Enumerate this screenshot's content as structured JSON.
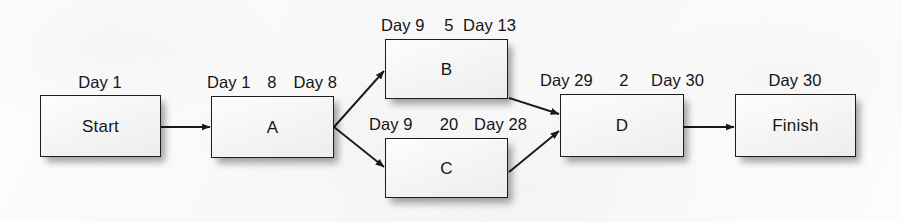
{
  "diagram": {
    "nodes": [
      {
        "id": "start",
        "label": "Start",
        "start_label": "Day 1",
        "duration": "",
        "finish_label": ""
      },
      {
        "id": "a",
        "label": "A",
        "start_label": "Day 1",
        "duration": "8",
        "finish_label": "Day 8"
      },
      {
        "id": "b",
        "label": "B",
        "start_label": "Day 9",
        "duration": "5",
        "finish_label": "Day 13"
      },
      {
        "id": "c",
        "label": "C",
        "start_label": "Day 9",
        "duration": "20",
        "finish_label": "Day 28"
      },
      {
        "id": "d",
        "label": "D",
        "start_label": "Day 29",
        "duration": "2",
        "finish_label": "Day 30"
      },
      {
        "id": "finish",
        "label": "Finish",
        "start_label": "Day 30",
        "duration": "",
        "finish_label": ""
      }
    ],
    "edges": [
      {
        "from": "start",
        "to": "a"
      },
      {
        "from": "a",
        "to": "b"
      },
      {
        "from": "a",
        "to": "c"
      },
      {
        "from": "b",
        "to": "d"
      },
      {
        "from": "c",
        "to": "d"
      },
      {
        "from": "d",
        "to": "finish"
      }
    ],
    "colors": {
      "background": "#fbfbfb",
      "box_border": "#1d1d1d",
      "box_fill": "#f6f6f6",
      "text": "#141414",
      "arrow": "#1a1a1a"
    }
  }
}
